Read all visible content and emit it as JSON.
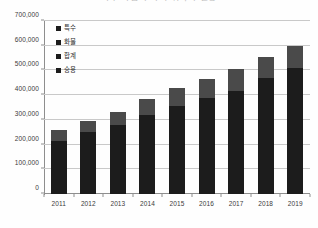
{
  "chart_data": {
    "type": "bar",
    "title": "특수 작업자 자격 취득자 현황",
    "xlabel": "",
    "ylabel": "",
    "ylim": [
      0,
      700000
    ],
    "ytick_labels": [
      "0",
      "100,000",
      "200,000",
      "300,000",
      "400,000",
      "500,000",
      "600,000",
      "700,000"
    ],
    "ytick_values": [
      0,
      100000,
      200000,
      300000,
      400000,
      500000,
      600000,
      700000
    ],
    "grid": true,
    "legend_position": "upper-left-inside",
    "categories": [
      "2011",
      "2012",
      "2013",
      "2014",
      "2015",
      "2016",
      "2017",
      "2018",
      "2019"
    ],
    "stacked": true,
    "series": [
      {
        "name": "승용",
        "color": "#1c1c1c",
        "values": [
          215000,
          250000,
          280000,
          320000,
          355000,
          390000,
          415000,
          470000,
          510000
        ]
      },
      {
        "name": "합계",
        "color": "#4a4a4a",
        "values": [
          45000,
          45000,
          50000,
          65000,
          75000,
          75000,
          90000,
          85000,
          90000
        ]
      }
    ],
    "totals": [
      260000,
      295000,
      330000,
      385000,
      430000,
      465000,
      505000,
      555000,
      600000
    ]
  },
  "legend": {
    "items": [
      {
        "label": "특수",
        "color": "#1c1c1c"
      },
      {
        "label": "화물",
        "color": "#1c1c1c"
      },
      {
        "label": "합계",
        "color": "#1c1c1c"
      },
      {
        "label": "승용",
        "color": "#1c1c1c"
      }
    ]
  },
  "colors": {
    "bar_dark": "#1c1c1c",
    "bar_gray": "#4a4a4a",
    "gridline": "#c9c9c9",
    "axis": "#8e8e8e",
    "text": "#3b3b3b",
    "background": "#fefefe"
  }
}
